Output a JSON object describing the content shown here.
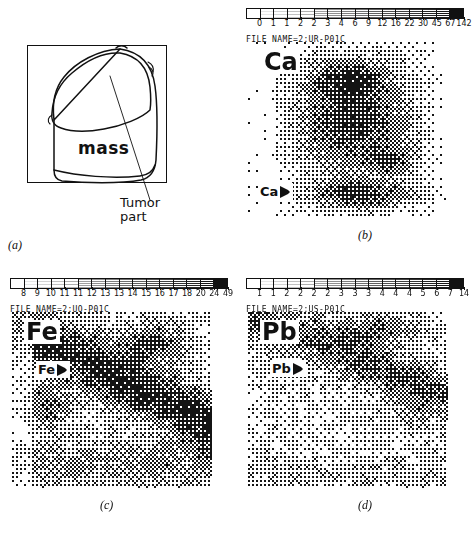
{
  "figure": {
    "type": "scientific-figure"
  },
  "panel_a": {
    "caption": "(a)",
    "mass_label": "mass",
    "tumor_label_line1": "Tumor",
    "tumor_label_line2": "part"
  },
  "panel_b": {
    "caption": "(b)",
    "element": "Ca",
    "arrow_label": "Ca",
    "file_name": "FILE NAME=2:UR-P01C",
    "scale_ticks": [
      "0",
      "1",
      "1",
      "2",
      "2",
      "3",
      "4",
      "6",
      "9",
      "12",
      "16",
      "22",
      "30",
      "45",
      "67",
      "142"
    ],
    "segments": 16
  },
  "panel_c": {
    "caption": "(c)",
    "element": "Fe",
    "arrow_label": "Fe",
    "file_name": "FILE NAME=2:UQ-P01C",
    "scale_ticks": [
      "8",
      "9",
      "10",
      "11",
      "11",
      "12",
      "13",
      "13",
      "14",
      "15",
      "16",
      "17",
      "18",
      "20",
      "24",
      "49"
    ],
    "segments": 16
  },
  "panel_d": {
    "caption": "(d)",
    "element": "Pb",
    "arrow_label": "Pb",
    "file_name": "FILE NAME=2:US-P01C",
    "scale_ticks": [
      "1",
      "1",
      "2",
      "2",
      "2",
      "2",
      "3",
      "3",
      "3",
      "4",
      "4",
      "4",
      "5",
      "6",
      "7",
      "14"
    ],
    "segments": 16
  },
  "colors": {
    "ink": "#111111",
    "paper": "#ffffff"
  }
}
